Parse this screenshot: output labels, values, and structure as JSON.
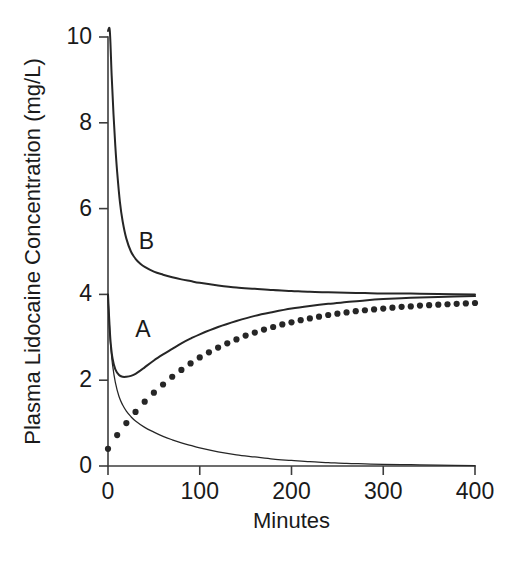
{
  "chart_data": {
    "type": "line",
    "title": "",
    "xlabel": "Minutes",
    "ylabel": "Plasma Lidocaine Concentration (mg/L)",
    "xlim": [
      0,
      400
    ],
    "ylim": [
      0,
      10
    ],
    "xticks": [
      0,
      100,
      200,
      300,
      400
    ],
    "yticks": [
      0,
      2,
      4,
      6,
      8,
      10
    ],
    "xticklabels": [
      "0",
      "100",
      "200",
      "300",
      "400"
    ],
    "yticklabels": [
      "0",
      "2",
      "4",
      "6",
      "8",
      "10"
    ],
    "grid": false,
    "legend": "none",
    "annotations": [
      {
        "text": "B",
        "x": 42,
        "y": 5.05,
        "name": "curve-label-b"
      },
      {
        "text": "A",
        "x": 38,
        "y": 3.0,
        "name": "curve-label-a"
      }
    ],
    "series": [
      {
        "name": "B",
        "style": "solid",
        "linewidth": 2.0,
        "description": "Bolus plus infusion regimen B: initial peak above 10 mg/L, rapid distribution decline to about 4.5 mg/L by 60 min, slow approach to steady state 4.0 mg/L",
        "x": [
          0,
          2,
          4,
          6,
          8,
          10,
          13,
          16,
          20,
          25,
          30,
          35,
          40,
          50,
          60,
          70,
          80,
          90,
          100,
          120,
          140,
          160,
          180,
          200,
          220,
          240,
          260,
          280,
          300,
          330,
          360,
          400
        ],
        "y": [
          11.4,
          10.2,
          9.1,
          8.2,
          7.45,
          6.85,
          6.15,
          5.7,
          5.3,
          5.0,
          4.83,
          4.72,
          4.64,
          4.53,
          4.46,
          4.4,
          4.35,
          4.31,
          4.27,
          4.21,
          4.16,
          4.13,
          4.1,
          4.08,
          4.06,
          4.05,
          4.04,
          4.03,
          4.02,
          4.02,
          4.01,
          4.0
        ]
      },
      {
        "name": "A",
        "style": "solid",
        "linewidth": 2.0,
        "description": "Bolus plus infusion regimen A: starts at 4.0 mg/L, dips to minimum near 2.1 mg/L at about 25 min, then climbs back toward steady state 4.0 mg/L",
        "x": [
          0,
          1,
          2,
          3,
          5,
          8,
          12,
          16,
          20,
          25,
          30,
          35,
          40,
          50,
          60,
          70,
          80,
          90,
          100,
          120,
          140,
          160,
          180,
          200,
          220,
          240,
          260,
          280,
          300,
          330,
          360,
          400
        ],
        "y": [
          4.0,
          3.55,
          3.15,
          2.85,
          2.5,
          2.25,
          2.12,
          2.08,
          2.08,
          2.1,
          2.15,
          2.22,
          2.3,
          2.46,
          2.6,
          2.73,
          2.86,
          2.97,
          3.07,
          3.24,
          3.38,
          3.5,
          3.59,
          3.67,
          3.73,
          3.78,
          3.82,
          3.86,
          3.89,
          3.92,
          3.94,
          3.96
        ]
      },
      {
        "name": "bolus-decay",
        "style": "solid",
        "linewidth": 1.25,
        "description": "Thin curve: contribution of the single bolus dose decaying from 4.0 mg/L toward zero",
        "x": [
          0,
          1,
          2,
          3,
          5,
          8,
          12,
          16,
          20,
          25,
          30,
          40,
          50,
          60,
          70,
          80,
          90,
          100,
          120,
          140,
          160,
          180,
          200,
          220,
          240,
          260,
          280,
          300,
          330,
          360,
          400
        ],
        "y": [
          4.0,
          3.5,
          3.1,
          2.78,
          2.35,
          1.95,
          1.62,
          1.42,
          1.28,
          1.15,
          1.05,
          0.9,
          0.79,
          0.69,
          0.61,
          0.54,
          0.48,
          0.42,
          0.33,
          0.26,
          0.21,
          0.16,
          0.13,
          0.1,
          0.08,
          0.06,
          0.05,
          0.04,
          0.03,
          0.02,
          0.01
        ]
      },
      {
        "name": "infusion-only",
        "style": "dotted",
        "linewidth": 0,
        "marker": "dot",
        "description": "Dotted curve: constant-rate infusion alone rising from about 0.4 mg/L toward steady state near 3.8 mg/L",
        "x": [
          0,
          10,
          20,
          30,
          40,
          50,
          60,
          70,
          80,
          90,
          100,
          110,
          120,
          130,
          140,
          150,
          160,
          170,
          180,
          190,
          200,
          210,
          220,
          230,
          240,
          250,
          260,
          270,
          280,
          290,
          300,
          310,
          320,
          330,
          340,
          350,
          360,
          370,
          380,
          390,
          400
        ],
        "y": [
          0.4,
          0.72,
          1.0,
          1.26,
          1.5,
          1.71,
          1.9,
          2.08,
          2.24,
          2.39,
          2.53,
          2.65,
          2.76,
          2.86,
          2.95,
          3.04,
          3.11,
          3.18,
          3.24,
          3.3,
          3.35,
          3.4,
          3.44,
          3.48,
          3.52,
          3.55,
          3.58,
          3.61,
          3.63,
          3.65,
          3.67,
          3.69,
          3.71,
          3.72,
          3.74,
          3.75,
          3.76,
          3.77,
          3.78,
          3.79,
          3.8
        ]
      }
    ]
  },
  "figure": {
    "background_color": "#ffffff",
    "ink_color": "#262626"
  }
}
